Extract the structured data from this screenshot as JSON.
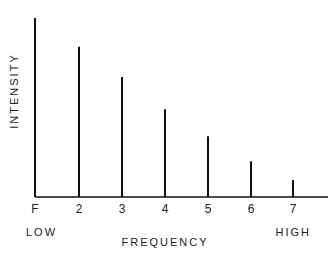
{
  "chart_data": {
    "type": "bar",
    "title": "",
    "xlabel": "FREQUENCY",
    "ylabel": "INTENSITY",
    "categories": [
      "F",
      "2",
      "3",
      "4",
      "5",
      "6",
      "7"
    ],
    "values": [
      10,
      8.4,
      6.7,
      4.9,
      3.4,
      2.0,
      0.95
    ],
    "ylim": [
      0,
      10
    ],
    "grid": false,
    "legend": null,
    "annotations": [
      {
        "text": "LOW",
        "position": "below-left"
      },
      {
        "text": "HIGH",
        "position": "below-right"
      }
    ]
  },
  "axis": {
    "x_label": "FREQUENCY",
    "y_label": "INTENSITY",
    "low_label": "LOW",
    "high_label": "HIGH"
  },
  "style": {
    "bar_color": "#111111",
    "axis_color": "#111111",
    "background": "#ffffff"
  }
}
